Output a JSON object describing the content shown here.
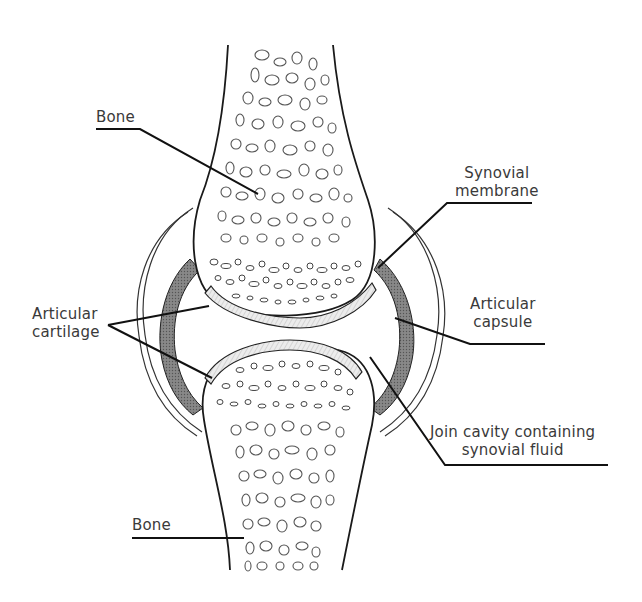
{
  "diagram": {
    "type": "anatomical-illustration",
    "colors": {
      "line": "#1a1a1a",
      "trabecular": "#555555",
      "cartilage_fill": "#e6e6e6",
      "membrane_fill": "#7a7a7a",
      "background": "#ffffff",
      "label_text": "#3a3a3a"
    },
    "labels": [
      {
        "id": "bone-top",
        "lines": [
          "Bone"
        ]
      },
      {
        "id": "synovial-membrane",
        "lines": [
          "Synovial",
          "membrane"
        ]
      },
      {
        "id": "articular-cartilage",
        "lines": [
          "Articular",
          "cartilage"
        ]
      },
      {
        "id": "articular-capsule",
        "lines": [
          "Articular",
          "capsule"
        ]
      },
      {
        "id": "joint-cavity",
        "lines": [
          "Join cavity containing",
          "synovial fluid"
        ]
      },
      {
        "id": "bone-bottom",
        "lines": [
          "Bone"
        ]
      }
    ]
  }
}
